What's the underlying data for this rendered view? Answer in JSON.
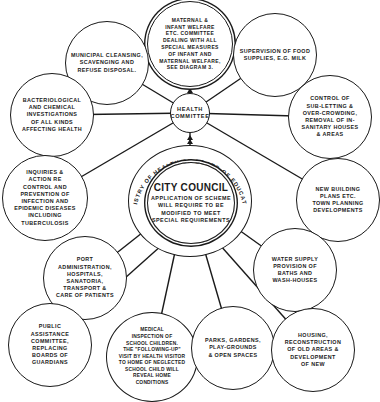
{
  "diagram": {
    "center": {
      "title": "CITY COUNCIL",
      "subtitle": "APPLICATION OF SCHEME\nWILL REQUIRE TO BE\nMODIFIED TO MEET\nSPECIAL REQUIREMENTS",
      "ring_text": "MINISTRY OF HEALTH OR BOARD OF EDUCATION"
    },
    "hub": {
      "label": "HEALTH\nCOMMITTEE"
    },
    "health_committee_nodes": [
      {
        "id": "maternal",
        "text": "MATERNAL &\nINFANT WELFARE\nETC. COMMITTEE\nDEALING WITH ALL\nSPECIAL MEASURES\nOF INFANT AND\nMATERNAL WELFARE,\nSEE DIAGRAM 3."
      },
      {
        "id": "municipal",
        "text": "MUNICIPAL CLEANSING,\nSCAVENGING AND\nREFUSE DISPOSAL."
      },
      {
        "id": "food",
        "text": "SUPERVISION OF FOOD\nSUPPLIES, E.G. MILK"
      },
      {
        "id": "bacteriological",
        "text": "BACTERIOLOGICAL\nAND CHEMICAL\nINVESTIGATIONS\nOF ALL KINDS\nAFFECTING HEALTH"
      },
      {
        "id": "subletting",
        "text": "CONTROL OF\nSUB-LETTING &\nOVER-CROWDING,\nREMOVAL OF IN-\nSANITARY HOUSES\n& AREAS"
      },
      {
        "id": "inquiries",
        "text": "INQUIRIES &\nACTION RE\nCONTROL AND\nPREVENTION OF\nINFECTION AND\nEPIDEMIC DISEASES\nINCLUDING\nTUBERCULOSIS"
      },
      {
        "id": "building",
        "text": "NEW BUILDING\nPLANS ETC.\nTOWN PLANNING\nDEVELOPMENTS"
      }
    ],
    "council_nodes": [
      {
        "id": "port",
        "text": "PORT\nADMINISTRATION,\nHOSPITALS,\nSANATORIA,\nTRANSPORT &\nCARE OF PATIENTS"
      },
      {
        "id": "water",
        "text": "WATER SUPPLY\nPROVISION OF\nBATHS AND\nWASH-HOUSES"
      },
      {
        "id": "public",
        "text": "PUBLIC\nASSISTANCE\nCOMMITTEE,\nREPLACING\nBOARDS OF\nGUARDIANS"
      },
      {
        "id": "medical",
        "text": "MEDICAL\nINSPECTION OF\nSCHOOL CHILDREN.\nTHE \"FOLLOWING-UP\"\nVISIT BY HEALTH VISITOR\nTO HOME OF NEGLECTED\nSCHOOL CHILD WILL\nREVEAL HOME\nCONDITIONS"
      },
      {
        "id": "parks",
        "text": "PARKS, GARDENS,\nPLAY-GROUNDS\n& OPEN SPACES"
      },
      {
        "id": "housing",
        "text": "HOUSING,\nRECONSTRUCTION\nOF OLD AREAS &\nDEVELOPMENT\nOF NEW"
      }
    ],
    "colors": {
      "ink": "#1a1a1a",
      "paper": "#ffffff"
    }
  }
}
